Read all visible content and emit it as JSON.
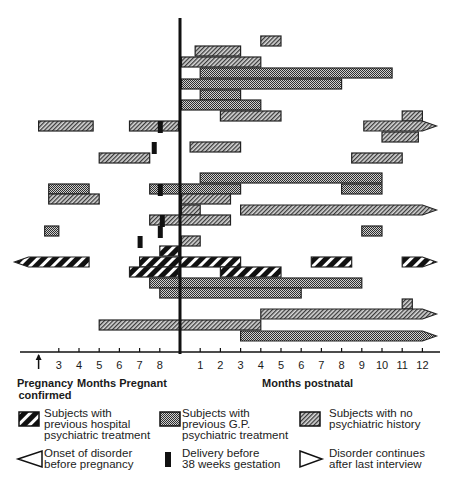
{
  "chart_data": {
    "type": "gantt",
    "title": "",
    "xlabel_pregnant": "Months Pregnant",
    "xlabel_postnatal": "Months postnatal",
    "confirmed_label": "Pregnancy confirmed",
    "confirmed_label_lines": [
      "Pregnancy",
      "confirmed"
    ],
    "time_unit": "months relative to delivery (negative = pregnant, positive = postnatal)",
    "xlim": [
      -8,
      13
    ],
    "pregnant_ticks": [
      {
        "label": "",
        "t": -7,
        "arrow": true
      },
      {
        "label": "3",
        "t": -6
      },
      {
        "label": "4",
        "t": -5
      },
      {
        "label": "5",
        "t": -4
      },
      {
        "label": "6",
        "t": -3
      },
      {
        "label": "7",
        "t": -2
      },
      {
        "label": "8",
        "t": -1
      }
    ],
    "postnatal_ticks": [
      {
        "label": "1",
        "t": 1
      },
      {
        "label": "2",
        "t": 2
      },
      {
        "label": "3",
        "t": 3
      },
      {
        "label": "4",
        "t": 4
      },
      {
        "label": "5",
        "t": 5
      },
      {
        "label": "6",
        "t": 6
      },
      {
        "label": "7",
        "t": 7
      },
      {
        "label": "8",
        "t": 8
      },
      {
        "label": "9",
        "t": 9
      },
      {
        "label": "10",
        "t": 10
      },
      {
        "label": "11",
        "t": 11
      },
      {
        "label": "12",
        "t": 12
      }
    ],
    "categories": {
      "hosp": "Subjects with previous hospital psychiatric treatment",
      "gp": "Subjects with previous G.P. psychiatric treatment",
      "none": "Subjects with no psychiatric history"
    },
    "rows": [
      {
        "segments": [
          {
            "cat": "none",
            "start": 4,
            "end": 5
          }
        ]
      },
      {
        "segments": [
          {
            "cat": "none",
            "start": 0.75,
            "end": 3
          }
        ]
      },
      {
        "segments": [
          {
            "cat": "none",
            "start": 0,
            "end": 4
          }
        ]
      },
      {
        "segments": [
          {
            "cat": "gp",
            "start": 1,
            "end": 10.5
          }
        ]
      },
      {
        "segments": [
          {
            "cat": "gp",
            "start": 0,
            "end": 8
          }
        ]
      },
      {
        "segments": [
          {
            "cat": "gp",
            "start": 1,
            "end": 3
          }
        ]
      },
      {
        "segments": [
          {
            "cat": "gp",
            "start": 0,
            "end": 4
          }
        ]
      },
      {
        "segments": [
          {
            "cat": "none",
            "start": 2,
            "end": 5
          },
          {
            "cat": "none",
            "start": 11,
            "end": 12
          }
        ]
      },
      {
        "segments": [
          {
            "cat": "none",
            "start": -7,
            "end": -4.3
          },
          {
            "cat": "none",
            "start": -2.5,
            "end": 0
          },
          {
            "cat": "none",
            "start": 9.1,
            "end": 12,
            "continues": true
          }
        ],
        "preterm_at": -1
      },
      {
        "segments": [
          {
            "cat": "none",
            "start": 10,
            "end": 11.8
          }
        ]
      },
      {
        "segments": [
          {
            "cat": "none",
            "start": 0.5,
            "end": 3
          }
        ],
        "preterm_at": -1.3
      },
      {
        "segments": [
          {
            "cat": "none",
            "start": -4,
            "end": -1.5
          },
          {
            "cat": "none",
            "start": 8.5,
            "end": 11
          }
        ]
      },
      {
        "segments": [
          {
            "cat": "gp",
            "start": 1,
            "end": 10
          }
        ]
      },
      {
        "segments": [
          {
            "cat": "gp",
            "start": -6.5,
            "end": -4.5
          },
          {
            "cat": "gp",
            "start": -1.5,
            "end": 3
          },
          {
            "cat": "gp",
            "start": 8,
            "end": 10
          }
        ],
        "preterm_at": -1
      },
      {
        "segments": [
          {
            "cat": "none",
            "start": -6.5,
            "end": -4
          },
          {
            "cat": "none",
            "start": 0,
            "end": 2.5
          }
        ]
      },
      {
        "segments": [
          {
            "cat": "none",
            "start": 0,
            "end": 1
          },
          {
            "cat": "none",
            "start": 3,
            "end": 12,
            "continues": true
          }
        ]
      },
      {
        "segments": [
          {
            "cat": "none",
            "start": -1.5,
            "end": 2.5
          }
        ],
        "preterm_at": -0.9
      },
      {
        "segments": [
          {
            "cat": "gp",
            "start": -6.7,
            "end": -6
          },
          {
            "cat": "gp",
            "start": 9,
            "end": 10
          }
        ],
        "preterm_at": -1
      },
      {
        "segments": [
          {
            "cat": "none",
            "start": 0,
            "end": 1
          }
        ],
        "preterm_at": -2
      },
      {
        "segments": [
          {
            "cat": "hosp",
            "start": -1,
            "end": 0
          }
        ]
      },
      {
        "segments": [
          {
            "cat": "hosp",
            "start": -7.5,
            "end": -4.5,
            "onset_before": true
          },
          {
            "cat": "hosp",
            "start": -2,
            "end": 3
          },
          {
            "cat": "hosp",
            "start": 6.5,
            "end": 8.5
          },
          {
            "cat": "hosp",
            "start": 11,
            "end": 12,
            "continues": true
          }
        ]
      },
      {
        "segments": [
          {
            "cat": "hosp",
            "start": -2.5,
            "end": 0
          },
          {
            "cat": "hosp",
            "start": 2,
            "end": 5
          }
        ]
      },
      {
        "segments": [
          {
            "cat": "gp",
            "start": -1.5,
            "end": 9
          }
        ]
      },
      {
        "segments": [
          {
            "cat": "gp",
            "start": -1,
            "end": 6
          }
        ]
      },
      {
        "segments": [
          {
            "cat": "none",
            "start": 11,
            "end": 11.5
          }
        ]
      },
      {
        "segments": [
          {
            "cat": "none",
            "start": 4,
            "end": 12,
            "continues": true
          }
        ]
      },
      {
        "segments": [
          {
            "cat": "none",
            "start": -4,
            "end": 4
          }
        ]
      },
      {
        "segments": [
          {
            "cat": "gp",
            "start": 3,
            "end": 12,
            "continues": true
          }
        ]
      }
    ],
    "legend": [
      {
        "key": "hosp",
        "lines": [
          "Subjects with",
          "previous hospital",
          "psychiatric treatment"
        ]
      },
      {
        "key": "gp",
        "lines": [
          "Subjects with",
          "previous G.P.",
          "psychiatric treatment"
        ]
      },
      {
        "key": "none",
        "lines": [
          "Subjects with no",
          "psychiatric history"
        ]
      },
      {
        "key": "onset",
        "lines": [
          "Onset of disorder",
          "before pregnancy"
        ]
      },
      {
        "key": "preterm",
        "lines": [
          "Delivery before",
          "38 weeks gestation"
        ]
      },
      {
        "key": "continues",
        "lines": [
          "Disorder continues",
          "after last interview"
        ]
      }
    ],
    "legend_placement": "bottom"
  }
}
